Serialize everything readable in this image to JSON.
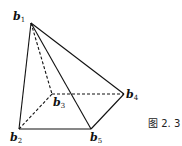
{
  "figure": {
    "caption": "图 2. 3",
    "vertices": [
      {
        "id": "b1",
        "base": "b",
        "sub": "1",
        "x": 31,
        "y": 23,
        "lx": 13,
        "ly": 20
      },
      {
        "id": "b2",
        "base": "b",
        "sub": "2",
        "x": 19,
        "y": 129,
        "lx": 10,
        "ly": 141
      },
      {
        "id": "b3",
        "base": "b",
        "sub": "3",
        "x": 52,
        "y": 94,
        "lx": 53,
        "ly": 106
      },
      {
        "id": "b4",
        "base": "b",
        "sub": "4",
        "x": 124,
        "y": 94,
        "lx": 126,
        "ly": 98
      },
      {
        "id": "b5",
        "base": "b",
        "sub": "5",
        "x": 91,
        "y": 129,
        "lx": 90,
        "ly": 141
      }
    ],
    "edges": [
      {
        "from": "b1",
        "to": "b2",
        "style": "solid"
      },
      {
        "from": "b1",
        "to": "b5",
        "style": "solid"
      },
      {
        "from": "b1",
        "to": "b4",
        "style": "solid"
      },
      {
        "from": "b2",
        "to": "b5",
        "style": "solid"
      },
      {
        "from": "b5",
        "to": "b4",
        "style": "solid"
      },
      {
        "from": "b1",
        "to": "b3",
        "style": "dashed"
      },
      {
        "from": "b2",
        "to": "b3",
        "style": "dashed"
      },
      {
        "from": "b3",
        "to": "b4",
        "style": "dashed"
      }
    ],
    "colors": {
      "line": "#111111",
      "background": "#ffffff"
    }
  }
}
